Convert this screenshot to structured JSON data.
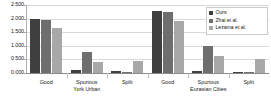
{
  "chart_data": {
    "type": "bar",
    "title": "",
    "xlabel": "",
    "ylabel": "",
    "ylim": [
      0.0,
      2.5
    ],
    "ytick_labels": [
      "2.500",
      "2.000",
      "1.500",
      "1.000",
      "0.500",
      "0.000"
    ],
    "ytick_values": [
      2.5,
      2.0,
      1.5,
      1.0,
      0.5,
      0.0
    ],
    "grid": true,
    "legend_position": "top-right",
    "categories": [
      "Good",
      "Spurious",
      "Split",
      "Good",
      "Spurious",
      "Split"
    ],
    "category_groups": [
      {
        "label": "Good",
        "sublabel": "",
        "dataset": "York Urban"
      },
      {
        "label": "Spurious",
        "sublabel": "York Urban",
        "dataset": "York Urban"
      },
      {
        "label": "Split",
        "sublabel": "",
        "dataset": "York Urban"
      },
      {
        "label": "Good",
        "sublabel": "",
        "dataset": "Eurasian Cities"
      },
      {
        "label": "Spurious",
        "sublabel": "Eurasian Cities",
        "dataset": "Eurasian Cities"
      },
      {
        "label": "Split",
        "sublabel": "",
        "dataset": "Eurasian Cities"
      }
    ],
    "series": [
      {
        "name": "Ours",
        "color": "#3f3f3f",
        "values": [
          1.99,
          0.11,
          0.07,
          2.28,
          0.07,
          0.03
        ]
      },
      {
        "name": "Zhai et al.",
        "color": "#6e6e6e",
        "values": [
          1.95,
          0.77,
          0.02,
          2.25,
          1.0,
          0.02
        ]
      },
      {
        "name": "Lezama et al.",
        "color": "#a8a8a8",
        "values": [
          1.67,
          0.41,
          0.44,
          1.93,
          0.62,
          0.52
        ]
      }
    ]
  },
  "legend": {
    "items": [
      {
        "label": "Ours",
        "color": "#3f3f3f"
      },
      {
        "label": "Zhai et al.",
        "color": "#6e6e6e"
      },
      {
        "label": "Lezama et al.",
        "color": "#a8a8a8"
      }
    ]
  },
  "colors": {
    "series_ours": "#3f3f3f",
    "series_zhai": "#6e6e6e",
    "series_lezama": "#a8a8a8",
    "gridline": "#d9d9d9",
    "axis": "#8a8a8a",
    "background": "#ffffff",
    "text": "#1a1a1a"
  }
}
